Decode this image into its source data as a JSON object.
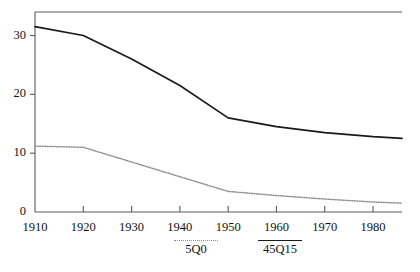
{
  "chart_data": {
    "type": "line",
    "title": "",
    "subtitle": "",
    "xlabel": "",
    "ylabel": "",
    "xlim": [
      1910,
      1986
    ],
    "ylim": [
      0,
      34
    ],
    "grid": false,
    "legend_position": "bottom-center",
    "xticks": [
      "1910",
      "1920",
      "1930",
      "1940",
      "1950",
      "1960",
      "1970",
      "1980"
    ],
    "xtick_values": [
      1910,
      1920,
      1930,
      1940,
      1950,
      1960,
      1970,
      1980
    ],
    "yticks": [
      "0",
      "10",
      "20",
      "30"
    ],
    "ytick_values": [
      0,
      10,
      20,
      30
    ],
    "x": [
      1910,
      1920,
      1930,
      1940,
      1950,
      1960,
      1970,
      1980,
      1986
    ],
    "series": [
      {
        "name": "45Q15",
        "style": "solid",
        "color": "#1a1a1a",
        "values": [
          31.5,
          30.0,
          26.0,
          21.5,
          16.0,
          14.5,
          13.5,
          12.8,
          12.5
        ]
      },
      {
        "name": "5Q0",
        "style": "dotted",
        "color": "#8e8e8e",
        "values": [
          11.2,
          11.0,
          8.5,
          6.0,
          3.5,
          2.8,
          2.2,
          1.7,
          1.5
        ]
      }
    ]
  },
  "legend": {
    "entries": [
      {
        "label": "5Q0",
        "style": "dotted"
      },
      {
        "label": "45Q15",
        "style": "solid"
      }
    ]
  },
  "colors": {
    "background": "#ffffff",
    "axis": "#4a4a4a",
    "solid_series": "#1a1a1a",
    "dotted_series": "#8e8e8e",
    "text": "#121212"
  }
}
